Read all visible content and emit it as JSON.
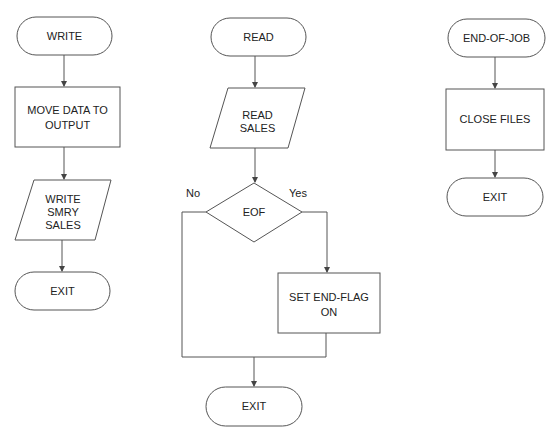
{
  "diagram": {
    "type": "flowchart",
    "colors": {
      "stroke": "#555555",
      "text": "#222222",
      "background": "#ffffff"
    },
    "flows": [
      {
        "name": "write",
        "nodes": [
          {
            "id": "write_start",
            "shape": "terminal",
            "lines": [
              "WRITE"
            ]
          },
          {
            "id": "move_data",
            "shape": "process",
            "lines": [
              "MOVE DATA TO",
              "OUTPUT"
            ]
          },
          {
            "id": "write_smry",
            "shape": "io",
            "lines": [
              "WRITE",
              "SMRY",
              "SALES"
            ]
          },
          {
            "id": "write_exit",
            "shape": "terminal",
            "lines": [
              "EXIT"
            ]
          }
        ]
      },
      {
        "name": "read",
        "nodes": [
          {
            "id": "read_start",
            "shape": "terminal",
            "lines": [
              "READ"
            ]
          },
          {
            "id": "read_sales",
            "shape": "io",
            "lines": [
              "READ",
              "SALES"
            ]
          },
          {
            "id": "eof",
            "shape": "decision",
            "lines": [
              "EOF"
            ]
          },
          {
            "id": "set_flag",
            "shape": "process",
            "lines": [
              "SET END-FLAG",
              "ON"
            ]
          },
          {
            "id": "read_exit",
            "shape": "terminal",
            "lines": [
              "EXIT"
            ]
          }
        ],
        "branches": {
          "no": "No",
          "yes": "Yes"
        }
      },
      {
        "name": "end_of_job",
        "nodes": [
          {
            "id": "eoj_start",
            "shape": "terminal",
            "lines": [
              "END-OF-JOB"
            ]
          },
          {
            "id": "close_files",
            "shape": "process",
            "lines": [
              "CLOSE FILES"
            ]
          },
          {
            "id": "eoj_exit",
            "shape": "terminal",
            "lines": [
              "EXIT"
            ]
          }
        ]
      }
    ]
  }
}
